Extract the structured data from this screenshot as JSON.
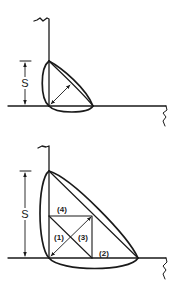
{
  "diagram": {
    "type": "fillet-weld-cross-section",
    "line_color": "#1a1a1a",
    "background": "#ffffff",
    "top_figure": {
      "dimension_label": "S",
      "description": "Small fillet weld at junction of vertical and horizontal plates with throat arrow"
    },
    "bottom_figure": {
      "dimension_label": "S",
      "description": "Large fillet weld subdivided into square with diagonals",
      "regions": [
        {
          "id": "4",
          "label": "(4)"
        },
        {
          "id": "1",
          "label": "(1)"
        },
        {
          "id": "3",
          "label": "(3)"
        },
        {
          "id": "2",
          "label": "(2)"
        }
      ]
    }
  }
}
